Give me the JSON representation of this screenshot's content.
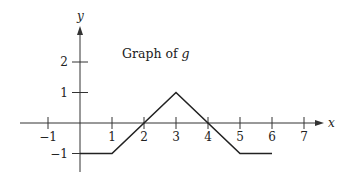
{
  "chart_data": {
    "type": "line",
    "title": "Graph of g",
    "title_parts": {
      "prefix": "Graph of ",
      "func": "g"
    },
    "xlabel": "x",
    "ylabel": "y",
    "x_ticks": [
      -1,
      1,
      2,
      3,
      4,
      5,
      6,
      7
    ],
    "x_tick_labels": [
      "−1",
      "1",
      "2",
      "3",
      "4",
      "5",
      "6",
      "7"
    ],
    "y_ticks": [
      -1,
      1,
      2
    ],
    "y_tick_labels": [
      "−1",
      "1",
      "2"
    ],
    "xlim": [
      -2,
      8
    ],
    "ylim": [
      -1.7,
      3.8
    ],
    "grid": false,
    "legend": null,
    "series": [
      {
        "name": "g",
        "x": [
          0,
          1,
          3,
          5,
          6
        ],
        "y": [
          -1,
          -1,
          1,
          -1,
          -1
        ]
      }
    ]
  }
}
